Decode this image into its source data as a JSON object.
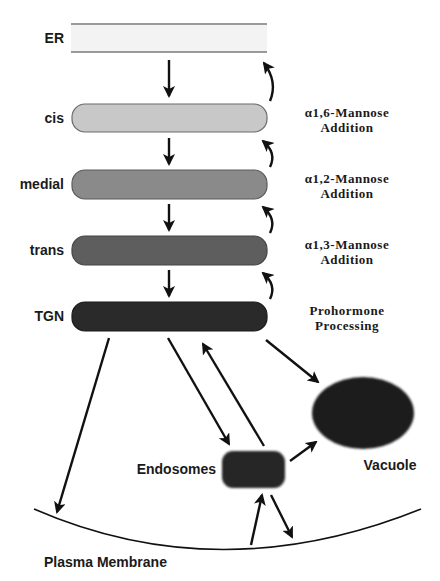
{
  "compartments": {
    "er": {
      "label": "ER",
      "fill": "#f3f3f3",
      "stroke": "#7a7a7a"
    },
    "cis": {
      "label": "cis",
      "fill": "#c8c8c8",
      "stroke": "#6a6a6a"
    },
    "medial": {
      "label": "medial",
      "fill": "#8a8a8a",
      "stroke": "#5a5a5a"
    },
    "trans": {
      "label": "trans",
      "fill": "#5e5e5e",
      "stroke": "#454545"
    },
    "tgn": {
      "label": "TGN",
      "fill": "#2a2a2a",
      "stroke": "#1a1a1a"
    },
    "endosomes": {
      "label": "Endosomes",
      "fill": "#262626"
    },
    "vacuole": {
      "label": "Vacuole",
      "fill": "#1e1e1e"
    },
    "plasma_membrane": {
      "label": "Plasma Membrane"
    }
  },
  "annotations": [
    {
      "line1": "α1,6-Mannose",
      "line2": "Addition",
      "compartment": "cis"
    },
    {
      "line1": "α1,2-Mannose",
      "line2": "Addition",
      "compartment": "medial"
    },
    {
      "line1": "α1,3-Mannose",
      "line2": "Addition",
      "compartment": "trans"
    },
    {
      "line1": "Prohormone",
      "line2": "Processing",
      "compartment": "TGN"
    }
  ],
  "flows": [
    {
      "from": "ER",
      "to": "cis",
      "type": "forward"
    },
    {
      "from": "cis",
      "to": "ER",
      "type": "retrograde"
    },
    {
      "from": "cis",
      "to": "medial",
      "type": "forward"
    },
    {
      "from": "medial",
      "to": "cis",
      "type": "retrograde"
    },
    {
      "from": "medial",
      "to": "trans",
      "type": "forward"
    },
    {
      "from": "trans",
      "to": "medial",
      "type": "retrograde"
    },
    {
      "from": "trans",
      "to": "TGN",
      "type": "forward"
    },
    {
      "from": "TGN",
      "to": "trans",
      "type": "retrograde"
    },
    {
      "from": "TGN",
      "to": "Plasma Membrane"
    },
    {
      "from": "TGN",
      "to": "Endosomes"
    },
    {
      "from": "Endosomes",
      "to": "TGN"
    },
    {
      "from": "TGN",
      "to": "Vacuole"
    },
    {
      "from": "Endosomes",
      "to": "Vacuole"
    },
    {
      "from": "Plasma Membrane",
      "to": "Endosomes"
    },
    {
      "from": "Endosomes",
      "to": "Plasma Membrane"
    }
  ]
}
